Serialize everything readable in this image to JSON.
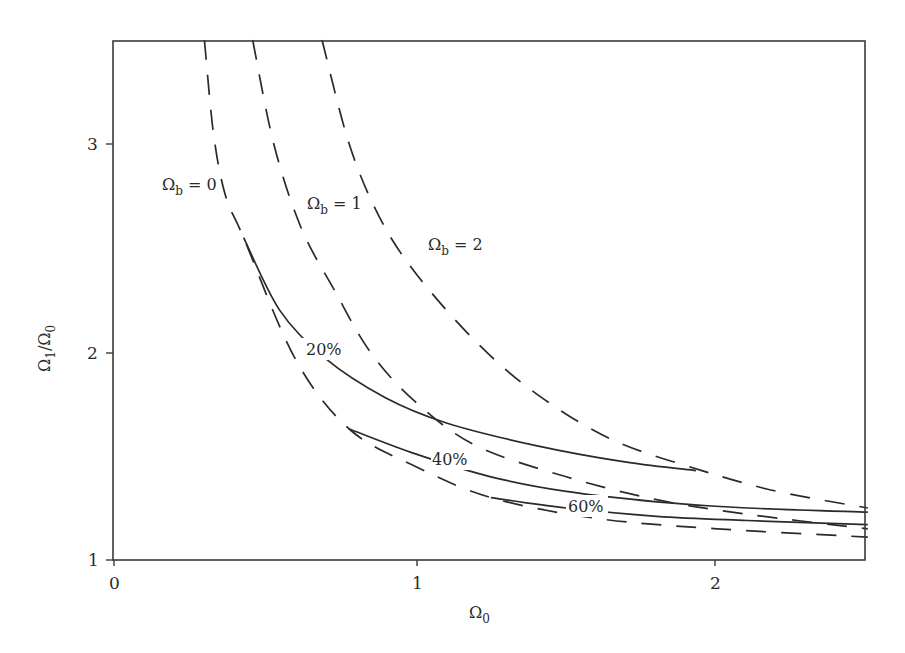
{
  "chart_data": {
    "type": "line",
    "title": "",
    "xlabel": "Ω0",
    "ylabel": "Ω1/Ω0",
    "xlim": [
      0,
      2.5
    ],
    "ylim": [
      1,
      3.5
    ],
    "x_ticks": [
      "0",
      "1",
      "2"
    ],
    "y_ticks": [
      "1",
      "2",
      "3"
    ],
    "grid": false,
    "legend": "none (inline curve labels)",
    "series": [
      {
        "name": "Ωb = 0",
        "style": "dashed",
        "x": [
          0.3,
          0.33,
          0.37,
          0.43,
          0.6,
          0.78,
          1.0,
          1.25,
          1.6,
          2.0,
          2.5
        ],
        "y": [
          3.5,
          3.05,
          2.75,
          2.55,
          1.97,
          1.63,
          1.45,
          1.3,
          1.2,
          1.15,
          1.11
        ]
      },
      {
        "name": "Ωb = 1",
        "style": "dashed",
        "x": [
          0.46,
          0.53,
          0.62,
          0.73,
          0.85,
          1.0,
          1.2,
          1.5,
          1.8,
          2.1,
          2.5
        ],
        "y": [
          3.5,
          3.0,
          2.6,
          2.3,
          2.0,
          1.76,
          1.55,
          1.4,
          1.29,
          1.22,
          1.15
        ]
      },
      {
        "name": "Ωb = 2",
        "style": "dashed",
        "x": [
          0.69,
          0.78,
          0.88,
          1.0,
          1.2,
          1.4,
          1.65,
          1.95,
          2.2,
          2.5
        ],
        "y": [
          3.5,
          3.0,
          2.65,
          2.38,
          2.05,
          1.8,
          1.58,
          1.43,
          1.33,
          1.25
        ]
      },
      {
        "name": "20%",
        "style": "solid",
        "x": [
          0.43,
          0.55,
          0.7,
          0.9,
          1.1,
          1.4,
          1.7,
          1.93
        ],
        "y": [
          2.55,
          2.2,
          1.97,
          1.78,
          1.66,
          1.55,
          1.47,
          1.43
        ]
      },
      {
        "name": "40%",
        "style": "solid",
        "x": [
          0.78,
          1.0,
          1.25,
          1.5,
          1.8,
          2.1,
          2.5
        ],
        "y": [
          1.63,
          1.51,
          1.4,
          1.33,
          1.28,
          1.25,
          1.23
        ]
      },
      {
        "name": "60%",
        "style": "solid",
        "x": [
          1.25,
          1.5,
          1.8,
          2.1,
          2.5
        ],
        "y": [
          1.3,
          1.25,
          1.21,
          1.19,
          1.17
        ]
      }
    ],
    "annotations": [
      {
        "text": "Ωb = 0",
        "x": 0.24,
        "y": 2.95
      },
      {
        "text": "Ωb = 1",
        "x": 0.68,
        "y": 2.7
      },
      {
        "text": "Ωb = 2",
        "x": 1.07,
        "y": 2.45
      },
      {
        "text": "20%",
        "x": 0.7,
        "y": 1.98
      },
      {
        "text": "40%",
        "x": 1.12,
        "y": 1.49
      },
      {
        "text": "60%",
        "x": 1.57,
        "y": 1.28
      }
    ]
  },
  "labels": {
    "x_axis": "Ω",
    "x_axis_sub": "0",
    "y_axis_num": "Ω",
    "y_axis_num_sub": "1",
    "y_axis_slash": "/Ω",
    "y_axis_den_sub": "0",
    "omega_b0": "Ω",
    "omega_b0_sub": "b",
    "omega_b0_val": " = 0",
    "omega_b1": "Ω",
    "omega_b1_sub": "b",
    "omega_b1_val": " = 1",
    "omega_b2": "Ω",
    "omega_b2_sub": "b",
    "omega_b2_val": " = 2",
    "pct20": "20%",
    "pct40": "40%",
    "pct60": "60%",
    "xt0": "0",
    "xt1": "1",
    "xt2": "2",
    "yt1": "1",
    "yt2": "2",
    "yt3": "3"
  }
}
